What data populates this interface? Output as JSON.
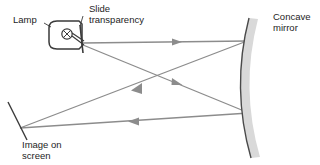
{
  "diagram": {
    "labels": {
      "lamp": "Lamp",
      "slide_line1": "Slide",
      "slide_line2": "transparency",
      "mirror_line1": "Concave",
      "mirror_line2": "mirror",
      "screen_line1": "Image on",
      "screen_line2": "screen"
    },
    "colors": {
      "ray": "#8c8c8c",
      "outline": "#3a3a3a",
      "mirror_face": "#555555",
      "mirror_body": "#d8d8d8",
      "text": "#1d1d1d",
      "background": "#ffffff"
    },
    "components": {
      "lamp": {
        "name": "lamp-housing",
        "bulb_symbol": "crossed-circle",
        "x": 52,
        "y": 20,
        "width": 32,
        "height": 30
      },
      "slide": {
        "name": "slide-transparency",
        "x": 81,
        "y_top": 24,
        "y_bottom": 52
      },
      "mirror": {
        "name": "concave-mirror",
        "top_x": 249,
        "top_y": 18,
        "bottom_x": 251,
        "bottom_y": 158,
        "bulge_x": 232,
        "thickness": 9
      },
      "screen": {
        "name": "image-screen",
        "x1": 8,
        "y1": 102,
        "x2": 27,
        "y2": 140
      }
    },
    "rays": [
      {
        "name": "ray-upper-outgoing",
        "from": [
          83,
          43
        ],
        "to": [
          247,
          41
        ],
        "arrow_at": [
          178,
          42
        ],
        "arrow_dir": "right"
      },
      {
        "name": "ray-lower-outgoing",
        "from": [
          83,
          45
        ],
        "to": [
          249,
          113
        ],
        "arrow_at": [
          182,
          85
        ],
        "arrow_dir": "right"
      },
      {
        "name": "ray-upper-reflected",
        "from": [
          247,
          41
        ],
        "to": [
          20,
          128
        ],
        "arrow_at": [
          140,
          87
        ],
        "arrow_dir": "left"
      },
      {
        "name": "ray-lower-reflected",
        "from": [
          249,
          113
        ],
        "to": [
          20,
          128
        ],
        "arrow_at": [
          138,
          121
        ],
        "arrow_dir": "left"
      }
    ],
    "leader_lines": [
      {
        "name": "lamp-leader",
        "from": [
          45,
          24
        ],
        "to": [
          54,
          28
        ]
      },
      {
        "name": "slide-leader",
        "from": [
          86,
          20
        ],
        "to": [
          81,
          28
        ]
      }
    ]
  }
}
